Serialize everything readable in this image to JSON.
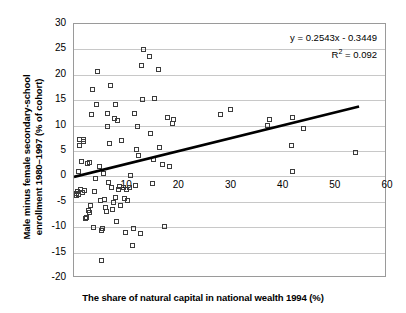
{
  "chart_data": {
    "type": "scatter",
    "title": "",
    "xlabel": "The share of natural capital in national wealth 1994 (%)",
    "ylabel_line1": "Male minus female secondary-school",
    "ylabel_line2": "enrollment 1980–1997 (% of cohort)",
    "xlim": [
      0,
      60
    ],
    "ylim": [
      -20,
      30
    ],
    "xticks": [
      "0",
      "10",
      "20",
      "30",
      "40",
      "50",
      "60"
    ],
    "xtick_values": [
      0,
      10,
      20,
      30,
      40,
      50,
      60
    ],
    "yticks": [
      "30",
      "25",
      "20",
      "15",
      "10",
      "5",
      "0",
      "-5",
      "-10",
      "-15",
      "-20"
    ],
    "ytick_values": [
      30,
      25,
      20,
      15,
      10,
      5,
      0,
      -5,
      -10,
      -15,
      -20
    ],
    "grid": "horizontal",
    "legend": "none",
    "marker": "open-square",
    "marker_color": "#3c3c3c",
    "trendline": {
      "equation": "y = 0.2543x - 0.3449",
      "r2_label": "R",
      "r2_sup": "2",
      "r2_value": " = 0.092",
      "slope": 0.2543,
      "intercept": -0.3449,
      "r2": 0.092,
      "x_start": 0,
      "x_end": 55,
      "color": "#000000",
      "width_px": 2.6
    },
    "points": [
      [
        0.4,
        -3.4
      ],
      [
        0.5,
        -3.8
      ],
      [
        0.6,
        -2.9
      ],
      [
        0.8,
        1.0
      ],
      [
        0.9,
        -3.5
      ],
      [
        1.0,
        7.2
      ],
      [
        1.1,
        6.0
      ],
      [
        1.3,
        -2.6
      ],
      [
        1.5,
        2.9
      ],
      [
        1.6,
        -3.2
      ],
      [
        1.8,
        7.3
      ],
      [
        1.9,
        6.9
      ],
      [
        2.0,
        -2.7
      ],
      [
        2.2,
        -8.3
      ],
      [
        2.4,
        -8.1
      ],
      [
        2.6,
        2.6
      ],
      [
        2.8,
        -6.7
      ],
      [
        2.9,
        -7.2
      ],
      [
        3.0,
        2.7
      ],
      [
        3.2,
        -5.7
      ],
      [
        3.4,
        12.1
      ],
      [
        3.6,
        17.1
      ],
      [
        3.8,
        -10.0
      ],
      [
        4.0,
        -2.9
      ],
      [
        4.2,
        -0.4
      ],
      [
        4.4,
        14.2
      ],
      [
        4.6,
        20.6
      ],
      [
        4.8,
        1.9
      ],
      [
        5.0,
        -4.7
      ],
      [
        5.2,
        -10.7
      ],
      [
        5.3,
        -16.6
      ],
      [
        5.5,
        -10.3
      ],
      [
        5.6,
        0.6
      ],
      [
        5.8,
        -4.6
      ],
      [
        6.0,
        -6.2
      ],
      [
        6.2,
        -6.9
      ],
      [
        6.4,
        12.3
      ],
      [
        6.5,
        9.9
      ],
      [
        6.6,
        -1.2
      ],
      [
        6.8,
        6.4
      ],
      [
        7.0,
        17.9
      ],
      [
        7.2,
        -2.2
      ],
      [
        7.4,
        -6.5
      ],
      [
        7.6,
        -5.2
      ],
      [
        7.8,
        11.3
      ],
      [
        7.9,
        14.2
      ],
      [
        8.0,
        -4.2
      ],
      [
        8.2,
        -8.8
      ],
      [
        8.4,
        11.0
      ],
      [
        8.6,
        -2.6
      ],
      [
        8.8,
        -1.9
      ],
      [
        9.0,
        -5.8
      ],
      [
        9.2,
        7.1
      ],
      [
        9.4,
        -2.1
      ],
      [
        9.6,
        -4.4
      ],
      [
        9.8,
        -11.0
      ],
      [
        10.0,
        -2.5
      ],
      [
        10.3,
        -4.8
      ],
      [
        10.6,
        -2.2
      ],
      [
        10.9,
        0.1
      ],
      [
        11.2,
        -13.6
      ],
      [
        11.4,
        -10.2
      ],
      [
        11.6,
        12.4
      ],
      [
        11.8,
        -1.8
      ],
      [
        12.0,
        5.2
      ],
      [
        12.2,
        9.9
      ],
      [
        12.4,
        4.2
      ],
      [
        12.8,
        -11.2
      ],
      [
        13.0,
        21.8
      ],
      [
        13.2,
        15.1
      ],
      [
        13.4,
        24.9
      ],
      [
        14.4,
        23.7
      ],
      [
        14.6,
        8.5
      ],
      [
        15.0,
        -1.3
      ],
      [
        15.2,
        3.4
      ],
      [
        15.4,
        15.3
      ],
      [
        16.2,
        21.1
      ],
      [
        16.4,
        5.7
      ],
      [
        17.0,
        2.3
      ],
      [
        17.4,
        -9.9
      ],
      [
        18.0,
        11.6
      ],
      [
        18.4,
        1.9
      ],
      [
        18.8,
        10.4
      ],
      [
        19.0,
        11.2
      ],
      [
        28.0,
        12.2
      ],
      [
        30.0,
        13.1
      ],
      [
        37.0,
        10.0
      ],
      [
        37.4,
        11.2
      ],
      [
        41.8,
        11.5
      ],
      [
        41.6,
        6.0
      ],
      [
        41.8,
        1.0
      ],
      [
        44.0,
        9.4
      ],
      [
        54.0,
        4.7
      ]
    ]
  }
}
